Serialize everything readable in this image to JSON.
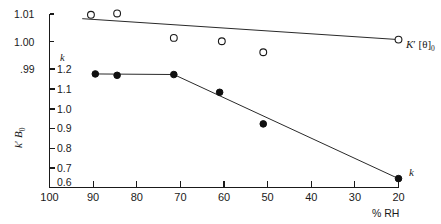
{
  "chart_data": {
    "type": "scatter",
    "title": "",
    "xlabel": "% RH",
    "x_ticks": [
      "100",
      "90",
      "80",
      "70",
      "60",
      "50",
      "40",
      "30",
      "20"
    ],
    "x_tick_values": [
      100,
      90,
      80,
      70,
      60,
      50,
      40,
      30,
      20
    ],
    "xlim": [
      100,
      20
    ],
    "x_axis_reversed": true,
    "grid": false,
    "legend_position": "inline-right",
    "left_axis_upper": {
      "label": "K' [θ]₀",
      "ticks": [
        "1.01",
        "1.00",
        ".99"
      ],
      "tick_values": [
        1.01,
        1.0,
        0.99
      ],
      "ylim": [
        0.99,
        1.01
      ]
    },
    "left_axis_lower": {
      "label": "k' B₀",
      "scale_key": "k",
      "ticks": [
        "1.2",
        "1.1",
        "1.0",
        "0.9",
        "0.8",
        "0.7",
        "0.6"
      ],
      "tick_values": [
        1.2,
        1.1,
        1.0,
        0.9,
        0.8,
        0.7,
        0.6
      ],
      "ylim": [
        0.6,
        1.2
      ]
    },
    "series": [
      {
        "name": "K' [θ]₀",
        "marker": "open-circle",
        "annotation": "K' [θ]₀",
        "axis": "left_axis_upper",
        "x": [
          90.5,
          84.5,
          71.5,
          60.5,
          51.0,
          20.0
        ],
        "values": [
          1.0097,
          1.0102,
          1.0013,
          1.0001,
          0.9961,
          1.0007
        ]
      },
      {
        "name": "k",
        "marker": "filled-circle",
        "annotation": "k",
        "axis": "left_axis_lower",
        "x": [
          89.5,
          84.5,
          71.5,
          61.0,
          51.0,
          20.0
        ],
        "values": [
          1.175,
          1.168,
          1.172,
          1.082,
          0.922,
          0.645
        ]
      }
    ],
    "fit_lines": [
      {
        "name": "K' [θ]₀ trend",
        "axis": "left_axis_upper",
        "points": [
          [
            92.5,
            1.0083
          ],
          [
            20.0,
            1.0007
          ]
        ]
      },
      {
        "name": "k trend",
        "axis": "left_axis_lower",
        "points": [
          [
            89.5,
            1.175
          ],
          [
            71.5,
            1.172
          ],
          [
            20.0,
            0.645
          ]
        ]
      }
    ]
  },
  "annotations": {
    "upper_series_label": "K",
    "upper_series_prime": "′",
    "upper_series_bracket": "[θ]",
    "upper_series_sub": "0",
    "lower_series_label": "k",
    "scale_marker_k": "k",
    "y_axis_lower_k": "k",
    "y_axis_lower_prime": "′",
    "y_axis_lower_b": "B",
    "y_axis_lower_sub": "0",
    "x_axis_title": "% RH"
  },
  "colors": {
    "axis": "#1a1a1a",
    "line": "#2a2a2a",
    "marker_fill": "#101010",
    "marker_open_fill": "#ffffff",
    "background": "#ffffff"
  }
}
